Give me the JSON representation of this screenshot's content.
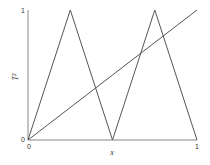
{
  "chart_data": {
    "type": "line",
    "title": "",
    "xlabel": "x",
    "ylabel": "T^2",
    "xlim": [
      0,
      1
    ],
    "ylim": [
      0,
      1
    ],
    "grid": false,
    "legend": null,
    "x_ticks": [
      "0",
      "1"
    ],
    "y_ticks": [
      "0",
      "1"
    ],
    "series": [
      {
        "name": "T^2 (second iterate of tent map)",
        "x": [
          0,
          0.25,
          0.5,
          0.75,
          1
        ],
        "y": [
          0,
          1,
          0,
          1,
          0
        ]
      },
      {
        "name": "y = x (diagonal)",
        "x": [
          0,
          1
        ],
        "y": [
          0,
          1
        ]
      }
    ]
  },
  "labels": {
    "xlabel": "x",
    "ylabel": "T²",
    "x_tick_0": "0",
    "x_tick_1": "1",
    "y_tick_0": "0",
    "y_tick_1": "1"
  },
  "colors": {
    "axis": "#888888",
    "line": "#555555"
  }
}
